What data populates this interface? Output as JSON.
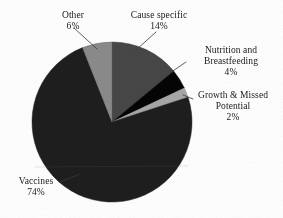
{
  "chart_data": {
    "type": "pie",
    "title": "",
    "subtitle": "",
    "xlabel": "",
    "ylabel": "",
    "legend_position": "none",
    "grid": false,
    "labels_show_percent": true,
    "categories": [
      "Vaccines",
      "Cause specific",
      "Other",
      "Nutrition and Breastfeeding",
      "Growth & Missed Potential"
    ],
    "values": [
      74,
      14,
      6,
      4,
      2
    ],
    "units": "%",
    "slices": [
      {
        "name": "Vaccines",
        "value": 74,
        "value_label": "74%",
        "color": "#1e1e1e",
        "label_position": "bottom-left"
      },
      {
        "name": "Cause specific",
        "value": 14,
        "value_label": "14%",
        "color": "#474747",
        "label_position": "top-right"
      },
      {
        "name": "Other",
        "value": 6,
        "value_label": "6%",
        "color": "#8b8b8b",
        "label_position": "top-left"
      },
      {
        "name": "Nutrition and Breastfeeding",
        "value": 4,
        "value_label": "4%",
        "color": "#050505",
        "label_position": "right"
      },
      {
        "name": "Growth & Missed Potential",
        "value": 2,
        "value_label": "2%",
        "color": "#a8a8a8",
        "label_position": "right"
      }
    ]
  },
  "labels": {
    "other": {
      "name": "Other",
      "value": "6%"
    },
    "cause": {
      "name": "Cause specific",
      "value": "14%"
    },
    "nutrition": {
      "line1": "Nutrition and",
      "line2": "Breastfeeding",
      "value": "4%"
    },
    "growth": {
      "line1": "Growth & Missed",
      "line2": "Potential",
      "value": "2%"
    },
    "vaccines": {
      "name": "Vaccines",
      "value": "74%"
    }
  },
  "geometry": {
    "center_x": 112,
    "center_y": 122,
    "radius": 80,
    "start_angle_deg": -90
  },
  "colors": {
    "background": "#ffffff",
    "text": "#1a1a1a",
    "leader_line": "#3a3a3a"
  }
}
